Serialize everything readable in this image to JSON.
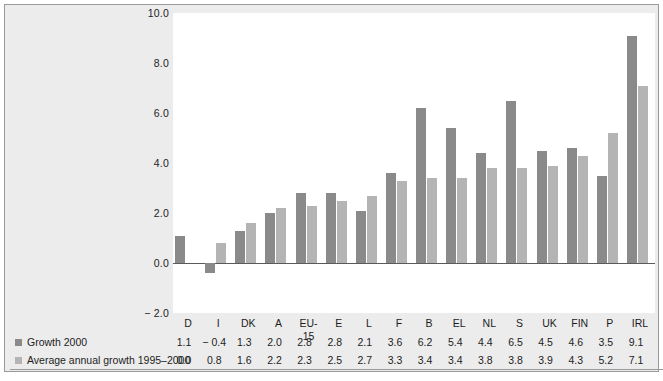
{
  "chart_data": {
    "type": "bar",
    "title": "",
    "subtitle": "",
    "xlabel": "",
    "ylabel": "",
    "ylim": [
      -2.0,
      10.0
    ],
    "yticks": [
      "10.0",
      "8.0",
      "6.0",
      "4.0",
      "2.0",
      "0.0",
      "− 2.0"
    ],
    "ytick_values": [
      10.0,
      8.0,
      6.0,
      4.0,
      2.0,
      0.0,
      -2.0
    ],
    "grid": false,
    "legend_position": "bottom-left",
    "categories": [
      "D",
      "I",
      "DK",
      "A",
      "EU-15",
      "E",
      "L",
      "F",
      "B",
      "EL",
      "NL",
      "S",
      "UK",
      "FIN",
      "P",
      "IRL"
    ],
    "series": [
      {
        "name": "Growth 2000",
        "color": "#8a8a8a",
        "values": [
          1.1,
          -0.4,
          1.3,
          2.0,
          2.8,
          2.8,
          2.1,
          3.6,
          6.2,
          5.4,
          4.4,
          6.5,
          4.5,
          4.6,
          3.5,
          9.1
        ],
        "labels": [
          "1.1",
          "− 0.4",
          "1.3",
          "2.0",
          "2.8",
          "2.8",
          "2.1",
          "3.6",
          "6.2",
          "5.4",
          "4.4",
          "6.5",
          "4.5",
          "4.6",
          "3.5",
          "9.1"
        ]
      },
      {
        "name": "Average annual growth 1995–2000",
        "color": "#b4b4b4",
        "values": [
          0.0,
          0.8,
          1.6,
          2.2,
          2.3,
          2.5,
          2.7,
          3.3,
          3.4,
          3.4,
          3.8,
          3.8,
          3.9,
          4.3,
          5.2,
          7.1
        ],
        "labels": [
          "0.0",
          "0.8",
          "1.6",
          "2.2",
          "2.3",
          "2.5",
          "2.7",
          "3.3",
          "3.4",
          "3.4",
          "3.8",
          "3.8",
          "3.9",
          "4.3",
          "5.2",
          "7.1"
        ]
      }
    ]
  },
  "footer": {
    "source_note": ""
  }
}
